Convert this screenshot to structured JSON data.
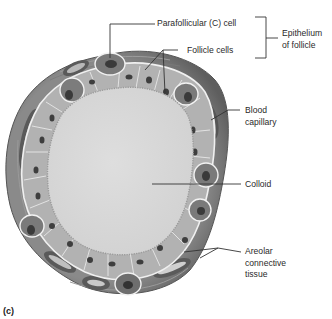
{
  "figure": {
    "panel_label": "(c)",
    "labels": {
      "parafollicular": "Parafollicular (C) cell",
      "follicle_cells": "Follicle cells",
      "epithelium_line1": "Epithelium",
      "epithelium_line2": "of follicle",
      "blood_line1": "Blood",
      "blood_line2": "capillary",
      "colloid": "Colloid",
      "areolar_line1": "Areolar",
      "areolar_line2": "connective",
      "areolar_line3": "tissue"
    },
    "colors": {
      "colloid": "#d9d9d9",
      "follicle_cell": "#b4b4b4",
      "parafollicular_cell": "#7a7a7a",
      "nucleus": "#3e3e3e",
      "connective_tissue": "#6e6e6e",
      "cell_border": "#f2f2f2",
      "leader_line": "#333333"
    }
  }
}
